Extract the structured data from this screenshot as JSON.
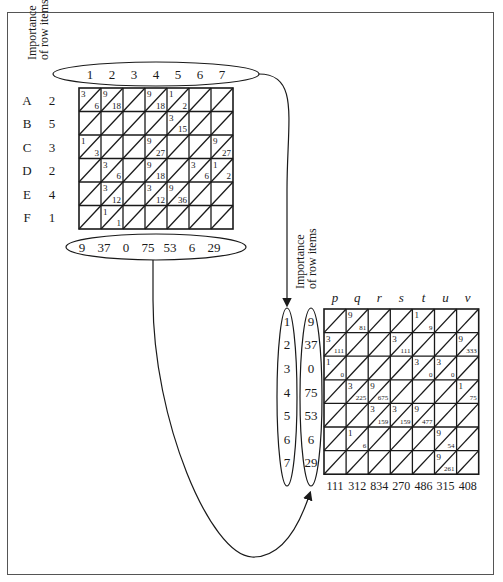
{
  "left_matrix": {
    "title_lines": [
      "Importance",
      "of row items"
    ],
    "column_labels": [
      "1",
      "2",
      "3",
      "4",
      "5",
      "6",
      "7"
    ],
    "rows": [
      {
        "name": "A",
        "importance": "2"
      },
      {
        "name": "B",
        "importance": "5"
      },
      {
        "name": "C",
        "importance": "3"
      },
      {
        "name": "D",
        "importance": "2"
      },
      {
        "name": "E",
        "importance": "4"
      },
      {
        "name": "F",
        "importance": "1"
      }
    ],
    "cells": [
      [
        [
          "3",
          "6"
        ],
        [
          "9",
          "18"
        ],
        null,
        [
          "9",
          "18"
        ],
        [
          "1",
          "2"
        ],
        null,
        null
      ],
      [
        null,
        null,
        null,
        null,
        [
          "3",
          "15"
        ],
        null,
        null
      ],
      [
        [
          "1",
          "3"
        ],
        null,
        null,
        [
          "9",
          "27"
        ],
        null,
        null,
        [
          "9",
          "27"
        ]
      ],
      [
        null,
        [
          "3",
          "6"
        ],
        null,
        [
          "9",
          "18"
        ],
        null,
        [
          "3",
          "6"
        ],
        [
          "1",
          "2"
        ]
      ],
      [
        null,
        [
          "3",
          "12"
        ],
        null,
        [
          "3",
          "12"
        ],
        [
          "9",
          "36"
        ],
        null,
        null
      ],
      [
        null,
        [
          "1",
          "1"
        ],
        null,
        null,
        null,
        null,
        null
      ]
    ],
    "column_sums": [
      "9",
      "37",
      "0",
      "75",
      "53",
      "6",
      "29"
    ]
  },
  "right_matrix": {
    "title_lines": [
      "Importance",
      "of row items"
    ],
    "column_labels": [
      "p",
      "q",
      "r",
      "s",
      "t",
      "u",
      "v"
    ],
    "row_index": [
      "1",
      "2",
      "3",
      "4",
      "5",
      "6",
      "7"
    ],
    "row_importance": [
      "9",
      "37",
      "0",
      "75",
      "53",
      "6",
      "29"
    ],
    "cells": [
      [
        null,
        [
          "9",
          "81"
        ],
        null,
        null,
        [
          "1",
          "9"
        ],
        null,
        null
      ],
      [
        [
          "3",
          "111"
        ],
        null,
        null,
        [
          "3",
          "111"
        ],
        null,
        null,
        [
          "9",
          "333"
        ]
      ],
      [
        [
          "1",
          "0"
        ],
        null,
        null,
        null,
        [
          "3",
          "0"
        ],
        [
          "3",
          "0"
        ],
        null
      ],
      [
        null,
        [
          "3",
          "225"
        ],
        [
          "9",
          "675"
        ],
        null,
        null,
        null,
        [
          "1",
          "75"
        ]
      ],
      [
        null,
        null,
        [
          "3",
          "159"
        ],
        [
          "3",
          "159"
        ],
        [
          "9",
          "477"
        ],
        null,
        null
      ],
      [
        null,
        [
          "1",
          "6"
        ],
        null,
        null,
        null,
        [
          "9",
          "54"
        ],
        null
      ],
      [
        null,
        null,
        null,
        null,
        null,
        [
          "9",
          "261"
        ],
        null
      ]
    ],
    "column_sums": [
      "111",
      "312",
      "834",
      "270",
      "486",
      "315",
      "408"
    ]
  }
}
